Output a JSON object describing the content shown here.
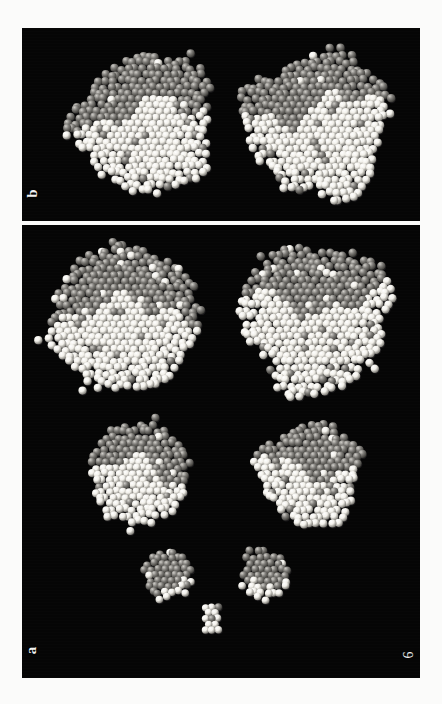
{
  "figure": {
    "number": "6",
    "background_color": "#fbfbfa",
    "panel_background_color": "#050505",
    "sphere_bright_color": "#f2f0ea",
    "sphere_dim_color": "#7e7c78",
    "sphere_shadow_color": "#19181a"
  },
  "panels": [
    {
      "id": "panel-b",
      "label": "b",
      "label_name": "panel-label-b",
      "x": 22,
      "y": 28,
      "width": 398,
      "height": 193,
      "clusters": [
        {
          "name": "cluster-b-1",
          "cx": 124,
          "cy": 96,
          "radius": 74,
          "atoms": 900,
          "facet": "rough",
          "split": 0.44,
          "seed": 11
        },
        {
          "name": "cluster-b-2",
          "cx": 296,
          "cy": 96,
          "radius": 78,
          "atoms": 980,
          "facet": "rough",
          "split": 0.4,
          "seed": 23
        }
      ]
    },
    {
      "id": "panel-a",
      "label": "a",
      "label_name": "panel-label-a",
      "x": 22,
      "y": 225,
      "width": 398,
      "height": 453,
      "clusters": [
        {
          "name": "cluster-a-1",
          "cx": 102,
          "cy": 93,
          "radius": 76,
          "atoms": 940,
          "facet": "round",
          "split": 0.46,
          "seed": 31
        },
        {
          "name": "cluster-a-2",
          "cx": 294,
          "cy": 93,
          "radius": 80,
          "atoms": 1010,
          "facet": "rough",
          "split": 0.4,
          "seed": 47
        },
        {
          "name": "cluster-a-3",
          "cx": 118,
          "cy": 249,
          "radius": 52,
          "atoms": 470,
          "facet": "round",
          "split": 0.48,
          "seed": 59
        },
        {
          "name": "cluster-a-4",
          "cx": 288,
          "cy": 249,
          "radius": 56,
          "atoms": 520,
          "facet": "rough",
          "split": 0.42,
          "seed": 67
        },
        {
          "name": "cluster-a-5",
          "cx": 146,
          "cy": 350,
          "radius": 25,
          "atoms": 120,
          "facet": "round",
          "split": 0.52,
          "seed": 73
        },
        {
          "name": "cluster-a-6",
          "cx": 242,
          "cy": 350,
          "radius": 26,
          "atoms": 125,
          "facet": "rough",
          "split": 0.48,
          "seed": 83
        },
        {
          "name": "cluster-a-7",
          "cx": 190,
          "cy": 394,
          "radius": 11,
          "atoms": 24,
          "facet": "cuboid",
          "split": 0.5,
          "seed": 97
        }
      ]
    }
  ],
  "caption": {
    "visible": false,
    "text": ""
  }
}
